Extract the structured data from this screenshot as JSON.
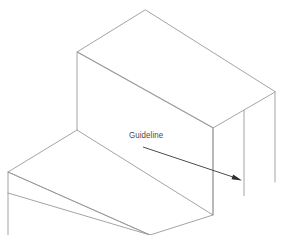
{
  "figure": {
    "background_color": "#ffffff",
    "width": 290,
    "height": 235
  },
  "annotations": {
    "guideline_label": "Guideline"
  },
  "colors": {
    "geometry_stroke": "#9a9a9a",
    "leader_stroke": "#3a3a3a",
    "arrow_fill": "#2e2e2e",
    "label_text": "#4a4a4a",
    "background": "#ffffff"
  },
  "geometry": {
    "upper_block": {
      "top_face": "145,10 77,52 213,128 275,92",
      "left_face": "77,52 77,130 213,215 213,128",
      "right_front_edge": "213,128 213,215"
    },
    "lower_step": {
      "top_face": "77,130 8,172 150,235 213,215",
      "left_edge": "8,172 8,235"
    },
    "back_right_edge": "275,92 275,182",
    "guideline_segment": {
      "x": 244,
      "y_top": 110,
      "y_bottom": 196,
      "description": "vertical construction line the callout points to"
    },
    "leader": {
      "start": "143,147",
      "end": "238,179",
      "arrow_tip": "240,180"
    }
  }
}
